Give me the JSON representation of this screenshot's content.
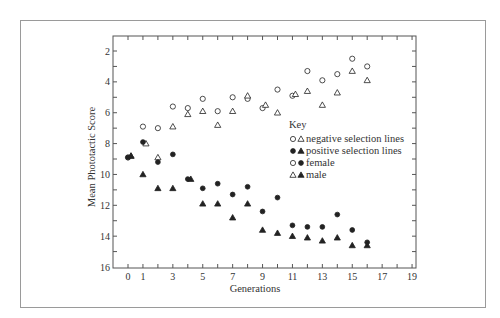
{
  "chart_data": {
    "type": "scatter",
    "title": "",
    "xlabel": "Generations",
    "ylabel": "Mean Phototactic Score",
    "xlim": [
      -1,
      19.3
    ],
    "ylim": [
      16,
      1.05
    ],
    "y_inverted": true,
    "grid": false,
    "x_tick_labels": [
      "0",
      "1",
      "3",
      "5",
      "7",
      "9",
      "11",
      "13",
      "15",
      "17",
      "19"
    ],
    "x_tick_values": [
      0,
      1,
      3,
      5,
      7,
      9,
      11,
      13,
      15,
      17,
      19
    ],
    "y_tick_labels": [
      "2",
      "4",
      "6",
      "8",
      "10",
      "12",
      "14",
      "16"
    ],
    "y_tick_values": [
      2,
      4,
      6,
      8,
      10,
      12,
      14,
      16
    ],
    "legend": {
      "title": "Key",
      "position": "inside-right",
      "entries": [
        {
          "symbols": [
            "open-circle",
            "open-triangle"
          ],
          "label": "negative selection lines"
        },
        {
          "symbols": [
            "filled-circle",
            "filled-triangle"
          ],
          "label": "positive selection lines"
        },
        {
          "symbols": [
            "open-circle",
            "filled-circle"
          ],
          "label": "female"
        },
        {
          "symbols": [
            "open-triangle",
            "filled-triangle"
          ],
          "label": "male"
        }
      ]
    },
    "series": [
      {
        "name": "negative selection lines, female",
        "marker": "open-circle",
        "x": [
          0,
          1,
          2,
          3,
          4,
          5,
          6,
          7,
          8,
          9,
          10,
          11,
          12,
          13,
          14,
          15,
          16
        ],
        "y": [
          8.9,
          6.9,
          7.0,
          5.6,
          5.7,
          5.1,
          5.9,
          5.0,
          5.1,
          5.7,
          4.5,
          4.9,
          3.3,
          3.9,
          3.5,
          2.5,
          3.0
        ]
      },
      {
        "name": "negative selection lines, male",
        "marker": "open-triangle",
        "x": [
          0.2,
          1.2,
          2,
          3,
          4,
          5,
          6,
          7,
          8,
          9.2,
          10,
          11.2,
          12,
          13,
          14,
          15,
          16
        ],
        "y": [
          8.8,
          8.0,
          8.9,
          6.9,
          6.1,
          5.9,
          6.8,
          5.9,
          4.9,
          5.5,
          6.0,
          4.8,
          4.6,
          5.5,
          4.7,
          3.3,
          3.9
        ]
      },
      {
        "name": "positive selection lines, female",
        "marker": "filled-circle",
        "x": [
          0,
          1,
          2,
          3,
          4,
          5,
          6,
          7,
          8,
          9,
          10,
          11,
          12,
          13,
          14,
          15,
          16
        ],
        "y": [
          8.9,
          7.9,
          9.2,
          8.7,
          10.3,
          10.9,
          10.6,
          11.3,
          10.8,
          12.4,
          11.5,
          13.3,
          13.4,
          13.4,
          12.6,
          13.6,
          14.4
        ]
      },
      {
        "name": "positive selection lines, male",
        "marker": "filled-triangle",
        "x": [
          0.2,
          1,
          2,
          3,
          4.2,
          5,
          6,
          7,
          8,
          9,
          10,
          11,
          12,
          13,
          14,
          15,
          16
        ],
        "y": [
          8.8,
          10.0,
          10.9,
          10.9,
          10.3,
          11.9,
          11.9,
          12.8,
          11.9,
          13.6,
          13.8,
          14.0,
          14.1,
          14.3,
          14.1,
          14.6,
          14.6
        ]
      }
    ]
  },
  "colors": {
    "ink": "#222222",
    "frame": "#555555",
    "outer_border": "#9a9a9a",
    "background": "#ffffff"
  }
}
